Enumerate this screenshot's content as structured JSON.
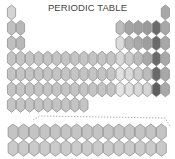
{
  "title": "PERIODIC TABLE",
  "main_grid": {
    "columns": 18,
    "rows": [
      {
        "period": 1,
        "cells": [
          {
            "col": 1,
            "shade": "#d4d4d4"
          },
          {
            "col": 18,
            "shade": "#a8a8a8"
          }
        ]
      },
      {
        "period": 2,
        "cells": [
          {
            "col": 1,
            "shade": "#c0c0c0"
          },
          {
            "col": 2,
            "shade": "#b8b8b8"
          },
          {
            "col": 13,
            "shade": "#bcbcbc"
          },
          {
            "col": 14,
            "shade": "#a4a4a4"
          },
          {
            "col": 15,
            "shade": "#a0a0a0"
          },
          {
            "col": 16,
            "shade": "#9a9a9a"
          },
          {
            "col": 17,
            "shade": "#6a6a6a"
          },
          {
            "col": 18,
            "shade": "#a8a8a8"
          }
        ]
      },
      {
        "period": 3,
        "cells": [
          {
            "col": 1,
            "shade": "#c0c0c0"
          },
          {
            "col": 2,
            "shade": "#b8b8b8"
          },
          {
            "col": 13,
            "shade": "#dcdcdc"
          },
          {
            "col": 14,
            "shade": "#b4b4b4"
          },
          {
            "col": 15,
            "shade": "#a8a8a8"
          },
          {
            "col": 16,
            "shade": "#9e9e9e"
          },
          {
            "col": 17,
            "shade": "#6a6a6a"
          },
          {
            "col": 18,
            "shade": "#a8a8a8"
          }
        ]
      },
      {
        "period": 4,
        "full": true,
        "default_shade": "#c4c4c4",
        "overrides": {
          "13": "#d8d8d8",
          "14": "#cccccc",
          "15": "#bcbcbc",
          "16": "#a8a8a8",
          "17": "#6a6a6a",
          "18": "#a8a8a8"
        }
      },
      {
        "period": 5,
        "full": true,
        "default_shade": "#c4c4c4",
        "overrides": {
          "13": "#e0e0e0",
          "14": "#dadada",
          "15": "#cccccc",
          "16": "#bcbcbc",
          "17": "#6a6a6a",
          "18": "#a8a8a8"
        }
      },
      {
        "period": 6,
        "full": true,
        "default_shade": "#c4c4c4",
        "overrides": {
          "13": "#e4e4e4",
          "14": "#e0e0e0",
          "15": "#d8d8d8",
          "16": "#d4d4d4",
          "17": "#5e5e5e",
          "18": "#a8a8a8"
        }
      },
      {
        "period": 7,
        "count": 9,
        "default_shade": "#c4c4c4"
      }
    ]
  },
  "f_block": {
    "rows": 2,
    "columns": 15,
    "shades": [
      "#c4c4c4",
      "#cacaca"
    ]
  },
  "colors": {
    "outline": "#8a8a8a",
    "connector": "#9a9a9a",
    "title_text": "#444444"
  }
}
